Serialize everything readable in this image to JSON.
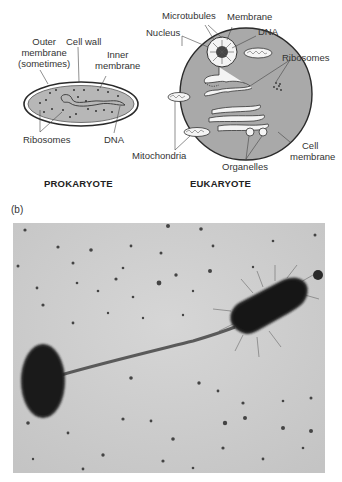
{
  "figure": {
    "part_a": {
      "prokaryote": {
        "title": "PROKARYOTE",
        "labels": {
          "outer_membrane": [
            "Outer",
            "membrane",
            "(sometimes)"
          ],
          "cell_wall": "Cell wall",
          "inner_membrane": [
            "Inner",
            "membrane"
          ],
          "ribosomes": "Ribosomes",
          "dna": "DNA"
        }
      },
      "eukaryote": {
        "title": "EUKARYOTE",
        "labels": {
          "microtubules": "Microtubules",
          "membrane": "Membrane",
          "nucleus": "Nucleus",
          "dna": "DNA",
          "ribosomes": "Ribosomes",
          "mitochondria": "Mitochondria",
          "organelles": "Organelles",
          "cell_membrane": [
            "Cell",
            "membrane"
          ]
        }
      }
    },
    "part_b": {
      "label": "(b)",
      "description": "Electron micrograph of two rod-shaped bacteria joined by a pilus"
    },
    "colors": {
      "cell_fill": "#a9a9a9",
      "cytoplasm_fill": "#b9b9b9",
      "outline": "#2a2a2a",
      "micrograph_bg": "#cfcfcf",
      "bacterium": "#1e1e1e"
    }
  }
}
